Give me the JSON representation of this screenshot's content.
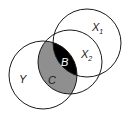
{
  "diagram": {
    "type": "venn",
    "circles": [
      {
        "id": "X1",
        "label": "X",
        "subscript": "1",
        "cx": 87,
        "cy": 43,
        "r": 34
      },
      {
        "id": "X2",
        "label": "X",
        "subscript": "2",
        "cx": 70,
        "cy": 62,
        "r": 32
      },
      {
        "id": "Y",
        "label": "Y",
        "subscript": "",
        "cx": 43,
        "cy": 75,
        "r": 34
      }
    ],
    "regions": [
      {
        "id": "C",
        "label": "C",
        "description": "X2 ∩ Y",
        "fill": "#8f8f8f"
      },
      {
        "id": "B",
        "label": "B",
        "description": "X1 ∩ X2 ∩ Y",
        "fill": "#000000"
      }
    ],
    "colors": {
      "stroke": "#1a1a1a",
      "background": "#ffffff",
      "label_on_dark": "#ffffff",
      "label_on_light": "#1a1a1a"
    }
  }
}
